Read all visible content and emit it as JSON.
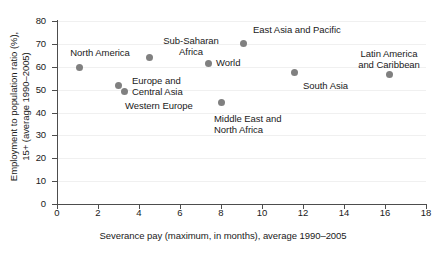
{
  "chart_data": {
    "type": "scatter",
    "title": "",
    "xlabel": "Severance pay (maximum, in months), average 1990–2005",
    "ylabel": "Employment to population ratio (%),\n15+ (average 1990–2005)",
    "ylabel_line1": "Employment to population ratio (%),",
    "ylabel_line2": "15+ (average 1990–2005)",
    "xlim": [
      0,
      18
    ],
    "ylim": [
      0,
      80
    ],
    "xticks": [
      0,
      2,
      4,
      6,
      8,
      10,
      12,
      14,
      16,
      18
    ],
    "yticks": [
      0,
      10,
      20,
      30,
      40,
      50,
      60,
      70,
      80
    ],
    "xtick_labels": [
      "0",
      "2",
      "4",
      "6",
      "8",
      "10",
      "12",
      "14",
      "16",
      "18"
    ],
    "ytick_labels": [
      "0",
      "10",
      "20",
      "30",
      "40",
      "50",
      "60",
      "70",
      "80"
    ],
    "grid": true,
    "legend": "none",
    "marker_color": "#808080",
    "axis_color": "#4d4d4d",
    "points": [
      {
        "label": "North America",
        "label_lines": [
          "North America"
        ],
        "x": 1.1,
        "y": 59.5,
        "label_pos": "above-left"
      },
      {
        "label": "Europe and Central Asia",
        "label_lines": [
          "Europe and",
          "Central Asia"
        ],
        "x": 3.0,
        "y": 52.0,
        "label_pos": "right"
      },
      {
        "label": "Western Europe",
        "label_lines": [
          "Western Europe"
        ],
        "x": 3.3,
        "y": 49.0,
        "label_pos": "below-right"
      },
      {
        "label": "Sub-Saharan Africa",
        "label_lines": [
          "Sub-Saharan",
          "Africa"
        ],
        "x": 4.5,
        "y": 64.0,
        "label_pos": "above-right"
      },
      {
        "label": "World",
        "label_lines": [
          "World"
        ],
        "x": 7.4,
        "y": 61.6,
        "label_pos": "right"
      },
      {
        "label": "Middle East and North Africa",
        "label_lines": [
          "Middle East and",
          "North Africa"
        ],
        "x": 8.0,
        "y": 44.6,
        "label_pos": "below"
      },
      {
        "label": "East Asia and Pacific",
        "label_lines": [
          "East Asia and Pacific"
        ],
        "x": 9.1,
        "y": 70.0,
        "label_pos": "above-right"
      },
      {
        "label": "South Asia",
        "label_lines": [
          "South Asia"
        ],
        "x": 11.6,
        "y": 57.7,
        "label_pos": "below-right"
      },
      {
        "label": "Latin America and Caribbean",
        "label_lines": [
          "Latin America",
          "and Caribbean"
        ],
        "x": 16.2,
        "y": 56.8,
        "label_pos": "above"
      }
    ]
  },
  "labels_rendered": {
    "north_america": "North America",
    "europe_central_asia_l1": "Europe and",
    "europe_central_asia_l2": "Central Asia",
    "western_europe": "Western Europe",
    "sub_saharan_l1": "Sub-Saharan",
    "sub_saharan_l2": "Africa",
    "world": "World",
    "middle_east_l1": "Middle East and",
    "middle_east_l2": "North Africa",
    "east_asia": "East Asia and Pacific",
    "south_asia": "South Asia",
    "latin_america_l1": "Latin America",
    "latin_america_l2": "and Caribbean"
  }
}
